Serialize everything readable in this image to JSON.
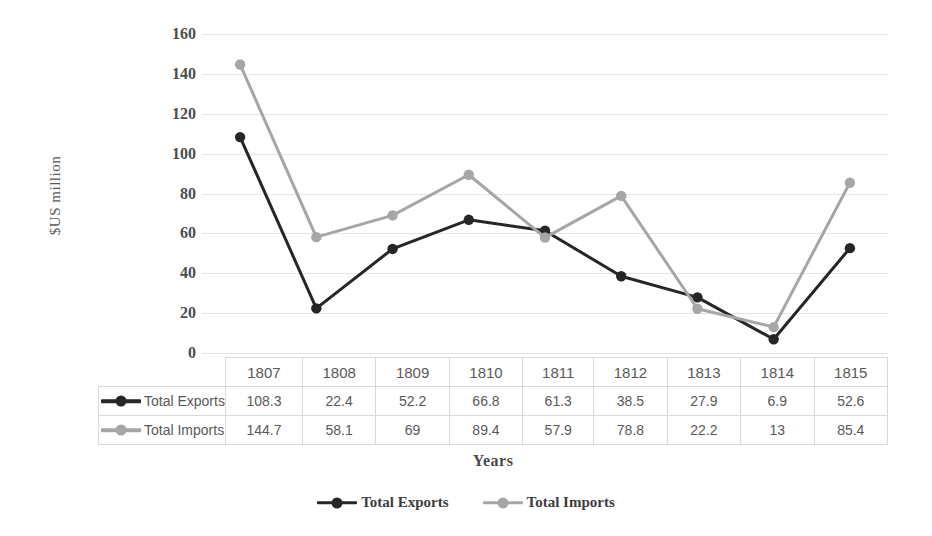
{
  "chart_data": {
    "type": "line",
    "title": "",
    "xlabel": "Years",
    "ylabel": "$US million",
    "categories": [
      "1807",
      "1808",
      "1809",
      "1810",
      "1811",
      "1812",
      "1813",
      "1814",
      "1815"
    ],
    "series": [
      {
        "name": "Total Exports",
        "color": "#262626",
        "marker": "circle",
        "values": [
          108.3,
          22.4,
          52.2,
          66.8,
          61.3,
          38.5,
          27.9,
          6.9,
          52.6
        ]
      },
      {
        "name": "Total Imports",
        "color": "#a6a6a6",
        "marker": "circle",
        "values": [
          144.7,
          58.1,
          69,
          89.4,
          57.9,
          78.8,
          22.2,
          13,
          85.4
        ]
      }
    ],
    "ylim": [
      0,
      160
    ],
    "yticks": [
      0,
      20,
      40,
      60,
      80,
      100,
      120,
      140,
      160
    ],
    "ytick_labels": [
      "0",
      "20",
      "40",
      "60",
      "80",
      "100",
      "120",
      "140",
      "160"
    ],
    "grid": "horizontal",
    "legend_position": "bottom",
    "data_table_shown": true
  },
  "axes": {
    "y_title": "$US million",
    "x_title": "Years"
  },
  "data_table": {
    "column_headers": [
      "1807",
      "1808",
      "1809",
      "1810",
      "1811",
      "1812",
      "1813",
      "1814",
      "1815"
    ],
    "rows": [
      {
        "label": "Total Exports",
        "values": [
          "108.3",
          "22.4",
          "52.2",
          "66.8",
          "61.3",
          "38.5",
          "27.9",
          "6.9",
          "52.6"
        ]
      },
      {
        "label": "Total Imports",
        "values": [
          "144.7",
          "58.1",
          "69",
          "89.4",
          "57.9",
          "78.8",
          "22.2",
          "13",
          "85.4"
        ]
      }
    ]
  },
  "legend": {
    "items": [
      {
        "label": "Total Exports",
        "color": "#262626"
      },
      {
        "label": "Total Imports",
        "color": "#a6a6a6"
      }
    ]
  },
  "colors": {
    "exports": "#262626",
    "imports": "#a6a6a6",
    "gridline": "#e3e6ea",
    "table_border": "#d9d9d9",
    "tick_text": "#4d4d4d"
  }
}
